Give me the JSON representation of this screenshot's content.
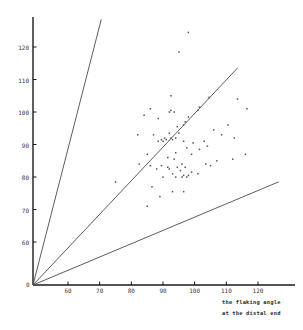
{
  "chart_data": {
    "type": "scatter",
    "title": "",
    "subtitle": "",
    "xlabel": "the flaking angle at the distal end",
    "ylabel": "",
    "xlim": [
      0,
      128
    ],
    "ylim": [
      0,
      132
    ],
    "grid": false,
    "legend": null,
    "x_ticks": [
      60,
      70,
      80,
      90,
      100,
      110,
      120
    ],
    "y_ticks": [
      60,
      70,
      80,
      90,
      100,
      110,
      120
    ],
    "origin_label": "0",
    "axis_color": "#1a1a1a",
    "point_color": "#555555",
    "line_color": "#4a4a4a",
    "reference_lines": [
      {
        "name": "upper-reference-line",
        "slope": 1.82,
        "x_end": 70.5,
        "y_end": 128.5
      },
      {
        "name": "middle-reference-line",
        "slope": 1.0,
        "x_end": 113.5,
        "y_end": 113.5
      },
      {
        "name": "lower-reference-line",
        "slope": 0.62,
        "x_end": 126.5,
        "y_end": 78.5
      }
    ],
    "points": [
      [
        98.0,
        124.5
      ],
      [
        95.0,
        118.5
      ],
      [
        92.5,
        105.0
      ],
      [
        104.5,
        104.5
      ],
      [
        86.0,
        101.0
      ],
      [
        113.5,
        104.0
      ],
      [
        101.5,
        101.5
      ],
      [
        92.5,
        100.5
      ],
      [
        92.0,
        100.0
      ],
      [
        93.5,
        100.0
      ],
      [
        116.5,
        101.0
      ],
      [
        84.0,
        99.0
      ],
      [
        88.5,
        98.0
      ],
      [
        98.0,
        98.5
      ],
      [
        97.0,
        97.0
      ],
      [
        96.5,
        96.0
      ],
      [
        110.5,
        96.0
      ],
      [
        101.0,
        100.5
      ],
      [
        94.5,
        95.5
      ],
      [
        106.0,
        94.5
      ],
      [
        82.0,
        93.0
      ],
      [
        87.0,
        93.0
      ],
      [
        92.0,
        93.5
      ],
      [
        95.0,
        93.5
      ],
      [
        90.5,
        92.0
      ],
      [
        92.5,
        92.0
      ],
      [
        94.0,
        92.0
      ],
      [
        108.5,
        93.0
      ],
      [
        89.5,
        91.5
      ],
      [
        91.0,
        91.5
      ],
      [
        93.0,
        91.5
      ],
      [
        96.5,
        91.0
      ],
      [
        103.0,
        91.0
      ],
      [
        112.5,
        92.0
      ],
      [
        88.5,
        91.0
      ],
      [
        90.0,
        91.0
      ],
      [
        99.5,
        90.5
      ],
      [
        104.0,
        89.5
      ],
      [
        97.5,
        89.0
      ],
      [
        101.5,
        88.5
      ],
      [
        85.0,
        87.0
      ],
      [
        94.0,
        87.5
      ],
      [
        99.0,
        87.0
      ],
      [
        116.0,
        87.0
      ],
      [
        91.5,
        86.0
      ],
      [
        93.5,
        85.5
      ],
      [
        107.0,
        85.0
      ],
      [
        112.0,
        85.5
      ],
      [
        82.5,
        84.0
      ],
      [
        96.0,
        84.0
      ],
      [
        103.5,
        84.0
      ],
      [
        86.0,
        83.5
      ],
      [
        89.5,
        83.5
      ],
      [
        91.5,
        83.0
      ],
      [
        94.5,
        83.0
      ],
      [
        97.0,
        83.0
      ],
      [
        105.0,
        83.5
      ],
      [
        88.0,
        82.5
      ],
      [
        92.0,
        82.5
      ],
      [
        95.5,
        82.0
      ],
      [
        99.0,
        81.5
      ],
      [
        101.0,
        81.0
      ],
      [
        93.0,
        81.0
      ],
      [
        96.5,
        80.5
      ],
      [
        98.0,
        80.5
      ],
      [
        90.0,
        80.0
      ],
      [
        94.0,
        80.0
      ],
      [
        96.0,
        80.0
      ],
      [
        97.5,
        80.0
      ],
      [
        75.0,
        78.5
      ],
      [
        86.5,
        77.0
      ],
      [
        93.0,
        75.5
      ],
      [
        96.5,
        75.5
      ],
      [
        89.0,
        74.0
      ],
      [
        85.0,
        71.0
      ]
    ]
  }
}
